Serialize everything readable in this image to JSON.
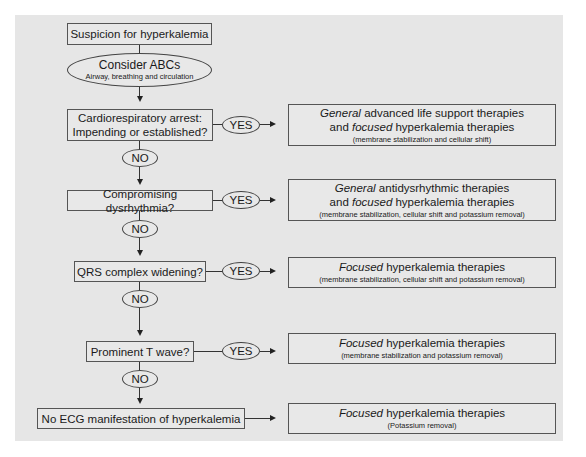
{
  "flowchart": {
    "start": "Suspicion for hyperkalemia",
    "abc": {
      "title": "Consider ABCs",
      "subtitle": "Airway, breathing and circulation"
    },
    "decisions": [
      {
        "question_line1": "Cardiorespiratory arrest:",
        "question_line2": "Impending or established?",
        "yes": "YES",
        "no": "NO"
      },
      {
        "question": "Compromising dysrhythmia?",
        "yes": "YES",
        "no": "NO"
      },
      {
        "question": "QRS complex widening?",
        "yes": "YES",
        "no": "NO"
      },
      {
        "question": "Prominent T wave?",
        "yes": "YES",
        "no": "NO"
      }
    ],
    "final": "No ECG manifestation of hyperkalemia",
    "outcomes": [
      {
        "l1_italic": "General",
        "l1_rest": " advanced life support therapies",
        "l2_pre": "and ",
        "l2_italic": "focused",
        "l2_rest": " hyperkalemia therapies",
        "sub": "(membrane stabilization and cellular shift)"
      },
      {
        "l1_italic": "General",
        "l1_rest": " antidysrhythmic therapies",
        "l2_pre": "and ",
        "l2_italic": "focused",
        "l2_rest": " hyperkalemia therapies",
        "sub": "(membrane stabilization, cellular shift and potassium removal)"
      },
      {
        "l1_italic": "Focused",
        "l1_rest": " hyperkalemia therapies",
        "sub": "(membrane stabilization, cellular shift and potassium removal)"
      },
      {
        "l1_italic": "Focused",
        "l1_rest": " hyperkalemia therapies",
        "sub": "(membrane stabilization and potassium removal)"
      },
      {
        "l1_italic": "Focused",
        "l1_rest": " hyperkalemia therapies",
        "sub": "(Potassium removal)"
      }
    ]
  }
}
